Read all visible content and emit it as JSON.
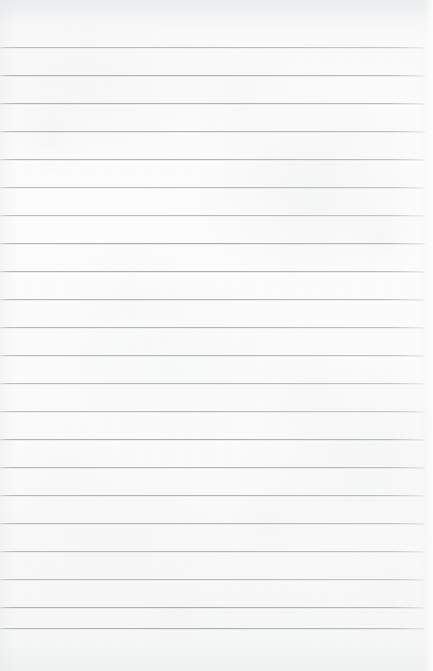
{
  "document": {
    "kind": "ruled-notebook-paper",
    "title": "Blank lined paper",
    "orientation": "portrait",
    "width_px": 433,
    "height_px": 671,
    "content_text": "",
    "has_handwriting": false,
    "has_printed_text": false
  },
  "paper": {
    "background_color": "#fbfbfb",
    "tone_light": "#fcfcfc",
    "tone_mid": "#f8f8f9",
    "tone_shadow": "#f4f5f6",
    "texture": "mottled fibrous grain",
    "vignette": "soft edge darkening, strongest along top band"
  },
  "ruling": {
    "line_color": "#a8abb1",
    "line_thickness_px": 1,
    "line_spacing_px": 28,
    "first_line_y_px": 47,
    "last_line_y_px": 628,
    "line_start_x_px": 0,
    "line_end_x_px": 425,
    "top_margin_px": 47,
    "bottom_margin_px": 43,
    "right_margin_px": 8,
    "left_margin_rule": "none",
    "line_count": 22,
    "line_positions_y_px": [
      47,
      75,
      103,
      131,
      159,
      187,
      215,
      243,
      271,
      299,
      327,
      355,
      383,
      411,
      439,
      467,
      495,
      523,
      551,
      579,
      607,
      628
    ]
  }
}
